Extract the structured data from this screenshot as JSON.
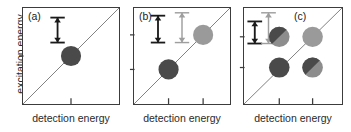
{
  "figure": {
    "axis_labels": {
      "y": "excitation energy",
      "x": "detection energy"
    },
    "panels": [
      {
        "tag": "(a)",
        "xlabel": "detection energy",
        "ticks": {
          "x": [
            0.5
          ],
          "y": [
            0.5
          ]
        },
        "arrows": [
          {
            "name": "dark-transition-arrow",
            "color": "#1a1a1a",
            "x": 0.36,
            "y_top": 0.1,
            "y_bottom": 0.36
          }
        ],
        "circles": [
          {
            "name": "diagonal-peak",
            "cx": 0.5,
            "cy": 0.5,
            "r": 0.105,
            "fill": "#4a4a4a",
            "style": "solid"
          }
        ]
      },
      {
        "tag": "(b)",
        "xlabel": "detection energy",
        "ticks": {
          "x": [
            0.36,
            0.72
          ],
          "y": [
            0.64,
            0.28
          ]
        },
        "arrows": [
          {
            "name": "dark-transition-arrow",
            "color": "#1a1a1a",
            "x": 0.25,
            "y_top": 0.08,
            "y_bottom": 0.36
          },
          {
            "name": "light-transition-arrow",
            "color": "#9e9e9e",
            "x": 0.5,
            "y_top": 0.05,
            "y_bottom": 0.36
          }
        ],
        "circles": [
          {
            "name": "lower-diagonal-peak",
            "cx": 0.36,
            "cy": 0.64,
            "r": 0.105,
            "fill": "#4a4a4a",
            "style": "solid"
          },
          {
            "name": "upper-diagonal-peak",
            "cx": 0.72,
            "cy": 0.28,
            "r": 0.105,
            "fill": "#9a9a9a",
            "style": "solid"
          }
        ]
      },
      {
        "tag": "(c)",
        "xlabel": "detection energy",
        "ticks": {
          "x": [
            0.36,
            0.7
          ],
          "y": [
            0.62,
            0.3
          ]
        },
        "arrows": [
          {
            "name": "dark-transition-arrow",
            "color": "#1a1a1a",
            "x": 0.11,
            "y_top": 0.14,
            "y_bottom": 0.37
          },
          {
            "name": "light-transition-arrow",
            "color": "#9e9e9e",
            "x": 0.25,
            "y_top": 0.05,
            "y_bottom": 0.37
          }
        ],
        "circles": [
          {
            "name": "cross-peak-upper-left",
            "cx": 0.36,
            "cy": 0.3,
            "r": 0.105,
            "fill": "#4a4a4a",
            "fill2": "#8d8d8d",
            "style": "split"
          },
          {
            "name": "diagonal-peak-upper-right",
            "cx": 0.7,
            "cy": 0.3,
            "r": 0.105,
            "fill": "#9a9a9a",
            "style": "solid"
          },
          {
            "name": "diagonal-peak-lower-left",
            "cx": 0.36,
            "cy": 0.62,
            "r": 0.105,
            "fill": "#4a4a4a",
            "style": "solid"
          },
          {
            "name": "cross-peak-lower-right",
            "cx": 0.7,
            "cy": 0.62,
            "r": 0.105,
            "fill": "#4a4a4a",
            "fill2": "#8d8d8d",
            "style": "split"
          }
        ]
      }
    ],
    "style": {
      "frame_color": "#3c3c3c",
      "diagonal_color": "#6e6e6e",
      "dark_fill": "#4a4a4a",
      "light_fill": "#9a9a9a",
      "background": "#ffffff"
    }
  }
}
